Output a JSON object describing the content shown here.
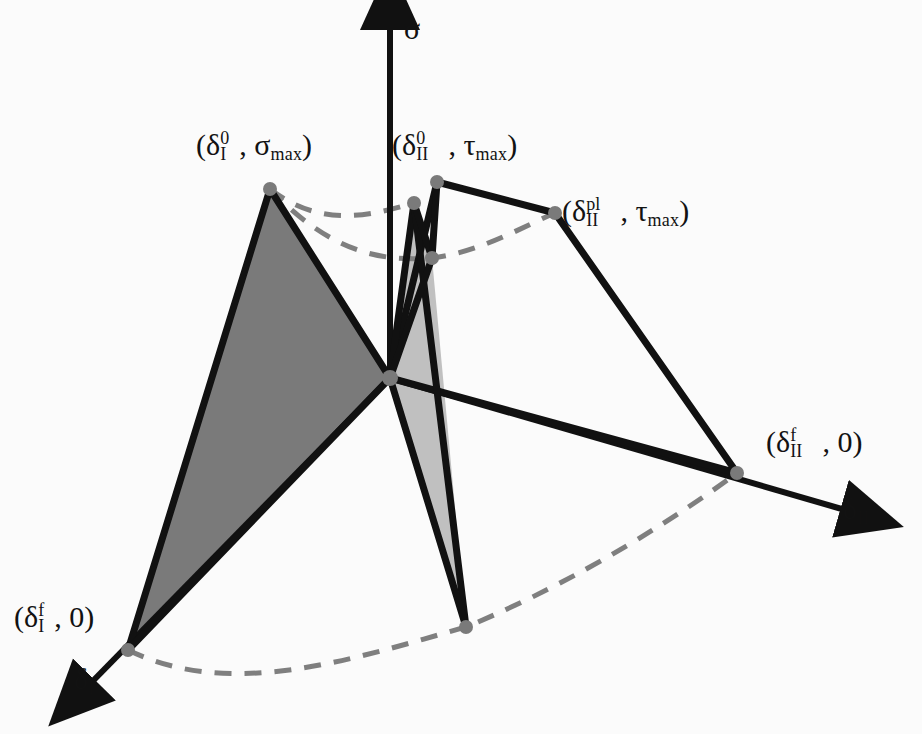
{
  "figure": {
    "background_color": "#fbfbfb",
    "line_color": "#111111",
    "dashed_color": "#7f7f7f",
    "dot_color": "#7a7a7a",
    "fill_dark": "#7a7a7a",
    "fill_light": "#c0c0c0"
  },
  "axes": [
    {
      "id": "sigma",
      "label": "σ",
      "label_x": 404,
      "label_y": 14,
      "from": [
        390,
        378
      ],
      "to": [
        390,
        18
      ],
      "description": "normal traction axis, vertical, arrow up"
    },
    {
      "id": "delta_II",
      "label_base": "δ",
      "label_sub": "II",
      "label_x": 843,
      "label_y": 494,
      "from": [
        390,
        378
      ],
      "to": [
        852,
        512
      ],
      "description": "mode II separation axis, arrow to lower right"
    },
    {
      "id": "delta_I",
      "label_base": "δ",
      "label_sub": "I",
      "label_x": 74,
      "label_y": 664,
      "from": [
        390,
        378
      ],
      "to": [
        86,
        688
      ],
      "description": "mode I separation axis, arrow to lower left"
    }
  ],
  "points": [
    {
      "id": "mode-i-peak",
      "x": 270,
      "y": 189,
      "label": "(δ_I^0, σ_max)",
      "label_x": 196,
      "label_y": 130,
      "parts": {
        "open": "(",
        "delta": "δ",
        "sub": "I",
        "sup": "0",
        "comma": ", ",
        "greek": "σ",
        "greek_sub": "max",
        "close": ")"
      }
    },
    {
      "id": "mode-ii-peak",
      "x": 437,
      "y": 182,
      "label": "(δ_II^0, τ_max)",
      "label_x": 392,
      "label_y": 130,
      "parts": {
        "open": "(",
        "delta": "δ",
        "sub": "II",
        "sup": "0",
        "comma": ", ",
        "greek": "τ",
        "greek_sub": "max",
        "close": ")"
      }
    },
    {
      "id": "mode-ii-plateau",
      "x": 555,
      "y": 213,
      "label": "(δ_II^pl, τ_max)",
      "label_x": 562,
      "label_y": 196,
      "parts": {
        "open": "(",
        "delta": "δ",
        "sub": "II",
        "sup": "pl",
        "comma": ", ",
        "greek": "τ",
        "greek_sub": "max",
        "close": ")"
      }
    },
    {
      "id": "mode-ii-failure",
      "x": 737,
      "y": 473,
      "label": "(δ_II^f, 0)",
      "label_x": 766,
      "label_y": 427,
      "parts": {
        "open": "(",
        "delta": "δ",
        "sub": "II",
        "sup": "f",
        "comma": ", ",
        "zero": "0",
        "close": ")"
      }
    },
    {
      "id": "mode-i-failure",
      "x": 128,
      "y": 650,
      "label": "(δ_I^f, 0)",
      "label_x": 14,
      "label_y": 602,
      "parts": {
        "open": "(",
        "delta": "δ",
        "sub": "I",
        "sup": "f",
        "comma": ", ",
        "zero": "0",
        "close": ")"
      }
    },
    {
      "id": "mixed-peak-inner",
      "x": 414,
      "y": 203,
      "label": "",
      "label_x": 0,
      "label_y": 0
    },
    {
      "id": "mixed-plateau-inner",
      "x": 432,
      "y": 258,
      "label": "",
      "label_x": 0,
      "label_y": 0
    },
    {
      "id": "mixed-failure-inner",
      "x": 466,
      "y": 627,
      "label": "",
      "label_x": 0,
      "label_y": 0
    },
    {
      "id": "origin",
      "x": 390,
      "y": 378,
      "label": "",
      "label_x": 0,
      "label_y": 0
    }
  ],
  "surfaces": [
    {
      "id": "mode-i-surface",
      "fill": "#7a7a7a",
      "points": "270,189 390,378 128,650",
      "description": "dark shaded mode I triangular cohesive surface"
    },
    {
      "id": "mixed-mode-surface",
      "fill": "#c0c0c0",
      "points": "414,203 432,258 466,627 390,378",
      "description": "light shaded mixed-mode cohesive surface"
    }
  ],
  "solid_edges": [
    {
      "id": "edge-i-peak-origin",
      "points": "270,189 390,378"
    },
    {
      "id": "edge-i-peak-failure",
      "points": "270,189 128,650"
    },
    {
      "id": "edge-i-failure-origin",
      "points": "128,650 390,378"
    },
    {
      "id": "edge-ii-peak-plateau",
      "points": "437,182 555,213"
    },
    {
      "id": "edge-ii-plateau-failure",
      "points": "555,213 737,473"
    },
    {
      "id": "edge-ii-failure-origin",
      "points": "737,473 390,378"
    },
    {
      "id": "edge-ii-peak-origin",
      "points": "437,182 390,378"
    },
    {
      "id": "edge-inner-peak-origin",
      "points": "414,203 390,378"
    },
    {
      "id": "edge-inner-peak-inner-failure",
      "points": "414,203 466,627"
    },
    {
      "id": "edge-inner-plateau-origin",
      "points": "432,258 390,378"
    },
    {
      "id": "edge-inner-plateau-inner-peak",
      "points": "432,258 414,203"
    },
    {
      "id": "edge-inner-failure-origin",
      "points": "466,627 390,378"
    },
    {
      "id": "edge-ii-peak-inner-plateau",
      "points": "437,182 432,258"
    }
  ],
  "dashed_curves": [
    {
      "id": "curve-peak-locus",
      "d": "M 270,189 C 320,228 370,216 414,203",
      "description": "dashed locus of damage-initiation peaks"
    },
    {
      "id": "curve-plateau-locus",
      "d": "M 270,189 C 330,252 380,262 432,258 C 480,252 520,228 555,213",
      "description": "dashed locus of plateau onset"
    },
    {
      "id": "curve-failure-locus",
      "d": "M 128,650 C 230,700 350,660 466,627 C 580,580 680,515 737,473",
      "description": "dashed locus of total-failure separations"
    }
  ]
}
